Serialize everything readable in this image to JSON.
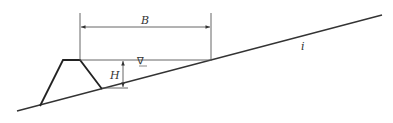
{
  "diagram": {
    "type": "cross-section",
    "labels": {
      "width": "B",
      "depth": "H",
      "slope": "i",
      "water_surface_symbol": "∇"
    },
    "colors": {
      "line": "#333333",
      "thin_line": "#555555",
      "background": "#ffffff"
    },
    "geometry": {
      "ground_line": [
        [
          17,
          111
        ],
        [
          382,
          15
        ]
      ],
      "dike_polygon": [
        [
          40,
          106
        ],
        [
          63,
          60
        ],
        [
          80,
          60
        ],
        [
          102,
          89
        ]
      ],
      "water_surface": [
        [
          80,
          60
        ],
        [
          211,
          60
        ]
      ],
      "extension_left": [
        [
          80,
          13
        ],
        [
          80,
          60
        ]
      ],
      "extension_right": [
        [
          211,
          13
        ],
        [
          211,
          61
        ]
      ],
      "B_dimension_y": 27,
      "H_dimension_x": 123,
      "H_dimension_range": [
        60,
        85
      ],
      "H_ground_tick": [
        [
          102,
          88
        ],
        [
          128,
          88
        ]
      ]
    }
  }
}
